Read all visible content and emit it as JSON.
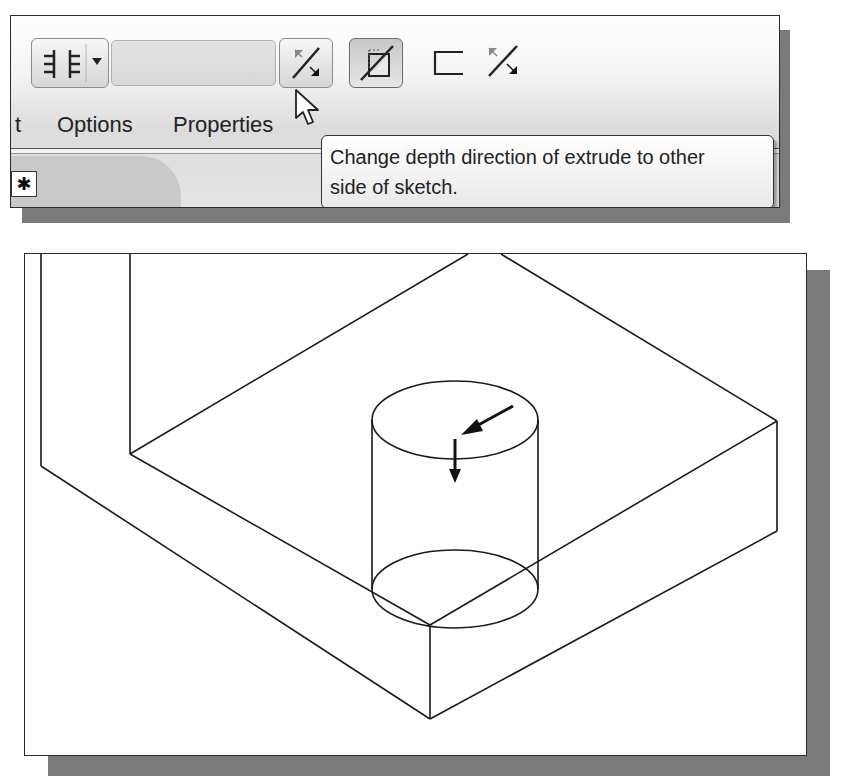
{
  "toolbar": {
    "layout_toggle": {
      "icon": "side-alignment-icon",
      "dropdown_icon": "dropdown-arrow-icon"
    },
    "depth_field": {
      "value": "",
      "placeholder": ""
    },
    "flip_direction_button": {
      "icon": "flip-depth-direction-icon",
      "state": "hover"
    },
    "plane_button": {
      "icon": "extrude-plane-icon",
      "state": "pressed"
    },
    "open_profile_button": {
      "icon": "open-profile-icon"
    },
    "flip_secondary_button": {
      "icon": "flip-direction-icon"
    }
  },
  "tabs": {
    "partial_label": "t",
    "options_label": "Options",
    "properties_label": "Properties"
  },
  "feature_icon": {
    "glyph": "✱"
  },
  "tooltip": {
    "line1": "Change depth direction of extrude to other",
    "line2": "side of sketch."
  },
  "diagram": {
    "line_color": "#1a1a1a"
  },
  "colors": {
    "shadow": "#7a7a7a",
    "border": "#2a2a2a",
    "panel_bg": "#ffffff"
  }
}
